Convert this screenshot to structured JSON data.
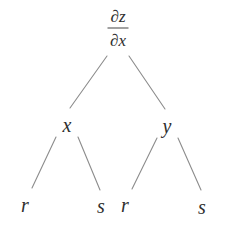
{
  "diagram": {
    "type": "tree",
    "root": {
      "numerator": "∂z",
      "denominator": "∂x"
    },
    "level1": [
      {
        "label": "x"
      },
      {
        "label": "y"
      }
    ],
    "level2": [
      {
        "label": "r",
        "parent": "x"
      },
      {
        "label": "s",
        "parent": "x"
      },
      {
        "label": "r",
        "parent": "y"
      },
      {
        "label": "s",
        "parent": "y"
      }
    ],
    "colors": {
      "line": "#8c8c8c",
      "text": "#2e2e2e",
      "background": "#ffffff"
    }
  }
}
